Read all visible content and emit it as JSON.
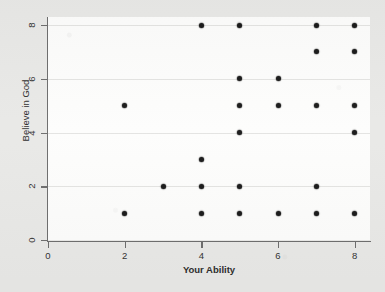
{
  "chart_data": {
    "type": "scatter",
    "title": "",
    "xlabel": "Your Ability",
    "ylabel": "Believe in God",
    "xlim": [
      0,
      8.4
    ],
    "ylim": [
      0,
      8.3
    ],
    "xticks": [
      0,
      2,
      4,
      6,
      8
    ],
    "yticks": [
      0,
      2,
      4,
      6,
      8
    ],
    "xtick_labels": [
      "0",
      "2",
      "4",
      "6",
      "8"
    ],
    "ytick_labels": [
      "0",
      "2",
      "4",
      "6",
      "8"
    ],
    "grid": "horizontal",
    "legend": "none",
    "marker": "filled-diamond",
    "marker_color": "#1b1b1b",
    "panel_color": "#fdfdfc",
    "figure_color": "#e9e9e7",
    "axis_color": "#6e6e6e",
    "gridline_color": "#e4e4e2",
    "n_points": 27,
    "points": [
      {
        "x": 2,
        "y": 5
      },
      {
        "x": 2,
        "y": 1
      },
      {
        "x": 3,
        "y": 2
      },
      {
        "x": 4,
        "y": 8
      },
      {
        "x": 4,
        "y": 3
      },
      {
        "x": 4,
        "y": 2
      },
      {
        "x": 4,
        "y": 1
      },
      {
        "x": 5,
        "y": 8
      },
      {
        "x": 5,
        "y": 6
      },
      {
        "x": 5,
        "y": 5
      },
      {
        "x": 5,
        "y": 4
      },
      {
        "x": 5,
        "y": 2
      },
      {
        "x": 5,
        "y": 1
      },
      {
        "x": 6,
        "y": 6
      },
      {
        "x": 6,
        "y": 5
      },
      {
        "x": 6,
        "y": 1
      },
      {
        "x": 7,
        "y": 8
      },
      {
        "x": 7,
        "y": 7
      },
      {
        "x": 7,
        "y": 5
      },
      {
        "x": 7,
        "y": 2
      },
      {
        "x": 7,
        "y": 1
      },
      {
        "x": 8,
        "y": 8
      },
      {
        "x": 8,
        "y": 7
      },
      {
        "x": 8,
        "y": 5
      },
      {
        "x": 8,
        "y": 4
      },
      {
        "x": 8,
        "y": 1
      }
    ]
  }
}
